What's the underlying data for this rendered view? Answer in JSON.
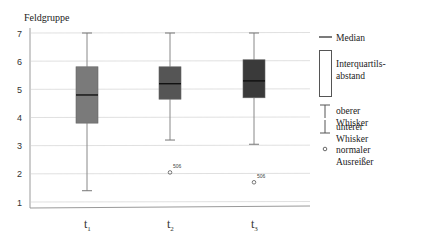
{
  "chart_data": {
    "type": "box",
    "title": "",
    "ylabel": "Feldgruppe",
    "xlabel": "",
    "ylim": [
      0.7,
      7.2
    ],
    "yticks": [
      1,
      2,
      3,
      4,
      5,
      6,
      7
    ],
    "grid": true,
    "categories": [
      "t1",
      "t2",
      "t3"
    ],
    "category_labels": [
      {
        "base": "t",
        "sub": "1"
      },
      {
        "base": "t",
        "sub": "2"
      },
      {
        "base": "t",
        "sub": "3"
      }
    ],
    "series": [
      {
        "name": "t1",
        "whisker_low": 1.4,
        "q1": 3.8,
        "median": 4.8,
        "q3": 5.8,
        "whisker_high": 7.0,
        "outliers": [],
        "color": "#7a7a7a"
      },
      {
        "name": "t2",
        "whisker_low": 3.2,
        "q1": 4.65,
        "median": 5.2,
        "q3": 5.8,
        "whisker_high": 7.0,
        "outliers": [
          {
            "value": 2.05,
            "label": "506"
          }
        ],
        "color": "#555555"
      },
      {
        "name": "t3",
        "whisker_low": 3.05,
        "q1": 4.7,
        "median": 5.3,
        "q3": 6.05,
        "whisker_high": 7.0,
        "outliers": [
          {
            "value": 1.7,
            "label": "506"
          }
        ],
        "color": "#3a3a3a"
      }
    ],
    "legend": {
      "position": "right",
      "entries": [
        {
          "symbol": "median-line",
          "label": "Median"
        },
        {
          "symbol": "iqr-box",
          "label": "Interquartils-abstand",
          "lines": [
            "Interquartils-",
            "abstand"
          ]
        },
        {
          "symbol": "upper-whisker",
          "label": "oberer Whisker"
        },
        {
          "symbol": "lower-whisker",
          "label": "unterer Whisker"
        },
        {
          "symbol": "outlier-circle",
          "label": "normaler Ausreißer",
          "lines": [
            "normaler",
            "Ausreißer"
          ]
        }
      ]
    }
  }
}
